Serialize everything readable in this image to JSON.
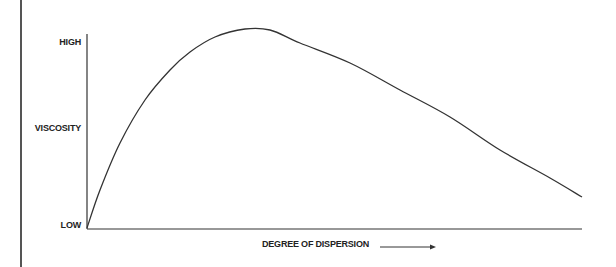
{
  "chart_data": {
    "type": "line",
    "title": "",
    "xlabel": "DEGREE OF DISPERSION",
    "ylabel": "VISCOSITY",
    "y_ticks": [
      "LOW",
      "HIGH"
    ],
    "x_arrow": true,
    "grid": false,
    "legend": null,
    "series": [
      {
        "name": "viscosity",
        "description": "Rises steeply from low, peaks at moderate dispersion, then declines gradually",
        "points_px": [
          [
            87,
            228
          ],
          [
            100,
            190
          ],
          [
            120,
            143
          ],
          [
            145,
            100
          ],
          [
            170,
            70
          ],
          [
            190,
            52
          ],
          [
            215,
            37
          ],
          [
            245,
            29
          ],
          [
            270,
            30
          ],
          [
            300,
            43
          ],
          [
            350,
            63
          ],
          [
            400,
            90
          ],
          [
            450,
            117
          ],
          [
            500,
            150
          ],
          [
            550,
            178
          ],
          [
            582,
            197
          ]
        ]
      }
    ]
  },
  "axes": {
    "y_high": "HIGH",
    "y_label": "VISCOSITY",
    "y_low": "LOW",
    "x_label": "DEGREE OF DISPERSION"
  }
}
